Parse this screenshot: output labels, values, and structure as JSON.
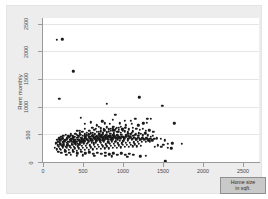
{
  "chart_data": {
    "type": "scatter",
    "title": "",
    "xlabel": "Home size in sqft.",
    "ylabel": "Rent monthly",
    "xlim": [
      0,
      2700
    ],
    "ylim": [
      0,
      2600
    ],
    "xticks": [
      0,
      500,
      1000,
      1500,
      2000,
      2500
    ],
    "yticks": [
      0,
      500,
      1000,
      1500,
      2000,
      2500
    ],
    "xtick_labels": [
      "0",
      "500",
      "1000",
      "1500",
      "2000",
      "2500"
    ],
    "ytick_labels": [
      "0",
      "500",
      "1000",
      "1500",
      "2000",
      "2500"
    ],
    "grid": "horizontal",
    "legend": "none",
    "marker_color": "#1a1a1a",
    "plot_bg": "#ffffff",
    "graph_bg": "#ededed",
    "gridline_color": "#e6e6e6",
    "points": [
      [
        170,
        2205
      ],
      [
        240,
        2215
      ],
      [
        380,
        1640
      ],
      [
        205,
        1145
      ],
      [
        800,
        1055
      ],
      [
        1205,
        1170
      ],
      [
        1490,
        1010
      ],
      [
        470,
        800
      ],
      [
        905,
        855
      ],
      [
        1305,
        785
      ],
      [
        1345,
        780
      ],
      [
        1640,
        700
      ],
      [
        775,
        700
      ],
      [
        835,
        690
      ],
      [
        700,
        640
      ],
      [
        960,
        700
      ],
      [
        1035,
        660
      ],
      [
        1110,
        690
      ],
      [
        1190,
        660
      ],
      [
        1255,
        700
      ],
      [
        1295,
        705
      ],
      [
        615,
        620
      ],
      [
        660,
        600
      ],
      [
        720,
        610
      ],
      [
        760,
        590
      ],
      [
        800,
        625
      ],
      [
        845,
        600
      ],
      [
        880,
        640
      ],
      [
        910,
        600
      ],
      [
        950,
        615
      ],
      [
        990,
        590
      ],
      [
        1030,
        620
      ],
      [
        1075,
        590
      ],
      [
        1120,
        620
      ],
      [
        1165,
        600
      ],
      [
        1210,
        585
      ],
      [
        1250,
        600
      ],
      [
        1285,
        560
      ],
      [
        1330,
        575
      ],
      [
        1380,
        545
      ],
      [
        1425,
        430
      ],
      [
        1470,
        420
      ],
      [
        1520,
        390
      ],
      [
        1560,
        330
      ],
      [
        1615,
        340
      ],
      [
        1735,
        330
      ],
      [
        430,
        560
      ],
      [
        460,
        520
      ],
      [
        490,
        545
      ],
      [
        520,
        500
      ],
      [
        545,
        530
      ],
      [
        570,
        490
      ],
      [
        595,
        515
      ],
      [
        620,
        480
      ],
      [
        645,
        505
      ],
      [
        670,
        470
      ],
      [
        695,
        495
      ],
      [
        715,
        465
      ],
      [
        740,
        490
      ],
      [
        765,
        455
      ],
      [
        790,
        480
      ],
      [
        815,
        450
      ],
      [
        840,
        470
      ],
      [
        865,
        440
      ],
      [
        890,
        465
      ],
      [
        915,
        435
      ],
      [
        940,
        460
      ],
      [
        965,
        430
      ],
      [
        990,
        455
      ],
      [
        1015,
        425
      ],
      [
        1040,
        450
      ],
      [
        1065,
        420
      ],
      [
        1090,
        445
      ],
      [
        1115,
        415
      ],
      [
        1140,
        440
      ],
      [
        1165,
        410
      ],
      [
        1190,
        435
      ],
      [
        1215,
        405
      ],
      [
        1240,
        430
      ],
      [
        1265,
        400
      ],
      [
        1290,
        425
      ],
      [
        1315,
        395
      ],
      [
        1340,
        420
      ],
      [
        1365,
        390
      ],
      [
        1390,
        415
      ],
      [
        160,
        330
      ],
      [
        185,
        300
      ],
      [
        210,
        350
      ],
      [
        235,
        290
      ],
      [
        260,
        330
      ],
      [
        285,
        270
      ],
      [
        310,
        320
      ],
      [
        335,
        280
      ],
      [
        360,
        330
      ],
      [
        385,
        270
      ],
      [
        410,
        320
      ],
      [
        435,
        285
      ],
      [
        460,
        335
      ],
      [
        485,
        290
      ],
      [
        510,
        340
      ],
      [
        535,
        295
      ],
      [
        560,
        345
      ],
      [
        585,
        300
      ],
      [
        610,
        350
      ],
      [
        635,
        305
      ],
      [
        660,
        355
      ],
      [
        685,
        310
      ],
      [
        710,
        360
      ],
      [
        735,
        315
      ],
      [
        760,
        365
      ],
      [
        785,
        320
      ],
      [
        810,
        370
      ],
      [
        835,
        325
      ],
      [
        860,
        375
      ],
      [
        885,
        330
      ],
      [
        910,
        380
      ],
      [
        935,
        335
      ],
      [
        960,
        385
      ],
      [
        985,
        340
      ],
      [
        1010,
        390
      ],
      [
        1035,
        345
      ],
      [
        1060,
        395
      ],
      [
        1085,
        350
      ],
      [
        1110,
        400
      ],
      [
        1135,
        355
      ],
      [
        1160,
        405
      ],
      [
        1185,
        360
      ],
      [
        1210,
        410
      ],
      [
        1235,
        365
      ],
      [
        1260,
        415
      ],
      [
        1285,
        370
      ],
      [
        1310,
        420
      ],
      [
        1335,
        375
      ],
      [
        150,
        260
      ],
      [
        175,
        230
      ],
      [
        200,
        270
      ],
      [
        225,
        225
      ],
      [
        250,
        265
      ],
      [
        275,
        220
      ],
      [
        300,
        260
      ],
      [
        325,
        215
      ],
      [
        350,
        255
      ],
      [
        375,
        210
      ],
      [
        400,
        250
      ],
      [
        425,
        205
      ],
      [
        450,
        245
      ],
      [
        475,
        215
      ],
      [
        500,
        255
      ],
      [
        525,
        220
      ],
      [
        550,
        260
      ],
      [
        575,
        225
      ],
      [
        600,
        265
      ],
      [
        625,
        230
      ],
      [
        650,
        270
      ],
      [
        675,
        235
      ],
      [
        700,
        275
      ],
      [
        725,
        240
      ],
      [
        750,
        280
      ],
      [
        775,
        245
      ],
      [
        800,
        285
      ],
      [
        825,
        250
      ],
      [
        850,
        290
      ],
      [
        875,
        255
      ],
      [
        900,
        295
      ],
      [
        925,
        260
      ],
      [
        950,
        300
      ],
      [
        975,
        265
      ],
      [
        1000,
        305
      ],
      [
        1025,
        270
      ],
      [
        1050,
        310
      ],
      [
        1075,
        275
      ],
      [
        1100,
        315
      ],
      [
        1125,
        280
      ],
      [
        1150,
        320
      ],
      [
        1175,
        285
      ],
      [
        1200,
        325
      ],
      [
        1225,
        290
      ],
      [
        300,
        430
      ],
      [
        330,
        455
      ],
      [
        355,
        410
      ],
      [
        380,
        445
      ],
      [
        405,
        400
      ],
      [
        430,
        440
      ],
      [
        455,
        395
      ],
      [
        480,
        435
      ],
      [
        505,
        400
      ],
      [
        530,
        445
      ],
      [
        555,
        405
      ],
      [
        580,
        450
      ],
      [
        605,
        410
      ],
      [
        630,
        455
      ],
      [
        655,
        415
      ],
      [
        680,
        460
      ],
      [
        705,
        420
      ],
      [
        730,
        465
      ],
      [
        755,
        425
      ],
      [
        780,
        470
      ],
      [
        805,
        430
      ],
      [
        830,
        475
      ],
      [
        855,
        435
      ],
      [
        880,
        480
      ],
      [
        905,
        440
      ],
      [
        930,
        485
      ],
      [
        955,
        445
      ],
      [
        980,
        490
      ],
      [
        1005,
        450
      ],
      [
        215,
        390
      ],
      [
        240,
        420
      ],
      [
        265,
        375
      ],
      [
        290,
        405
      ],
      [
        315,
        370
      ],
      [
        340,
        400
      ],
      [
        365,
        360
      ],
      [
        390,
        395
      ],
      [
        415,
        365
      ],
      [
        440,
        405
      ],
      [
        465,
        370
      ],
      [
        490,
        410
      ],
      [
        515,
        375
      ],
      [
        540,
        415
      ],
      [
        565,
        380
      ],
      [
        590,
        420
      ],
      [
        615,
        385
      ],
      [
        640,
        425
      ],
      [
        665,
        390
      ],
      [
        690,
        430
      ],
      [
        715,
        395
      ],
      [
        740,
        435
      ],
      [
        765,
        400
      ],
      [
        790,
        440
      ],
      [
        815,
        405
      ],
      [
        840,
        445
      ],
      [
        865,
        410
      ],
      [
        890,
        450
      ],
      [
        915,
        415
      ],
      [
        190,
        180
      ],
      [
        230,
        170
      ],
      [
        280,
        190
      ],
      [
        330,
        165
      ],
      [
        380,
        185
      ],
      [
        430,
        160
      ],
      [
        480,
        180
      ],
      [
        530,
        155
      ],
      [
        580,
        175
      ],
      [
        630,
        150
      ],
      [
        680,
        170
      ],
      [
        730,
        145
      ],
      [
        780,
        165
      ],
      [
        830,
        140
      ],
      [
        880,
        160
      ],
      [
        930,
        135
      ],
      [
        980,
        155
      ],
      [
        1030,
        130
      ],
      [
        1080,
        150
      ],
      [
        1130,
        125
      ],
      [
        460,
        560
      ],
      [
        520,
        600
      ],
      [
        580,
        565
      ],
      [
        640,
        580
      ],
      [
        700,
        545
      ],
      [
        760,
        560
      ],
      [
        820,
        545
      ],
      [
        880,
        575
      ],
      [
        940,
        540
      ],
      [
        1000,
        560
      ],
      [
        1060,
        535
      ],
      [
        1120,
        555
      ],
      [
        520,
        690
      ],
      [
        600,
        720
      ],
      [
        670,
        665
      ],
      [
        740,
        735
      ],
      [
        870,
        760
      ],
      [
        1020,
        745
      ],
      [
        1100,
        745
      ],
      [
        1155,
        775
      ],
      [
        255,
        470
      ],
      [
        285,
        495
      ],
      [
        315,
        465
      ],
      [
        345,
        500
      ],
      [
        375,
        470
      ],
      [
        405,
        505
      ],
      [
        435,
        475
      ],
      [
        465,
        490
      ],
      [
        1530,
        10
      ],
      [
        1055,
        95
      ],
      [
        860,
        100
      ],
      [
        780,
        115
      ],
      [
        640,
        110
      ],
      [
        500,
        120
      ],
      [
        420,
        115
      ],
      [
        350,
        130
      ],
      [
        290,
        125
      ],
      [
        1215,
        105
      ],
      [
        1285,
        115
      ],
      [
        1400,
        270
      ],
      [
        1435,
        300
      ],
      [
        1480,
        275
      ],
      [
        1505,
        310
      ],
      [
        1560,
        255
      ],
      [
        1605,
        250
      ],
      [
        210,
        240
      ],
      [
        255,
        300
      ],
      [
        300,
        345
      ],
      [
        345,
        385
      ],
      [
        390,
        355
      ],
      [
        435,
        330
      ],
      [
        480,
        375
      ],
      [
        525,
        420
      ],
      [
        570,
        440
      ],
      [
        615,
        470
      ],
      [
        660,
        445
      ],
      [
        705,
        500
      ],
      [
        750,
        515
      ],
      [
        795,
        530
      ],
      [
        840,
        505
      ],
      [
        885,
        520
      ],
      [
        930,
        545
      ],
      [
        975,
        525
      ],
      [
        1020,
        555
      ],
      [
        1065,
        505
      ],
      [
        1110,
        530
      ],
      [
        1155,
        490
      ],
      [
        1200,
        520
      ],
      [
        180,
        405
      ],
      [
        205,
        430
      ],
      [
        230,
        460
      ],
      [
        250,
        425
      ],
      [
        270,
        395
      ],
      [
        295,
        415
      ],
      [
        320,
        445
      ],
      [
        345,
        470
      ],
      [
        370,
        430
      ],
      [
        395,
        455
      ],
      [
        420,
        490
      ],
      [
        445,
        465
      ],
      [
        470,
        440
      ],
      [
        495,
        475
      ],
      [
        520,
        465
      ],
      [
        545,
        480
      ],
      [
        570,
        500
      ],
      [
        595,
        460
      ],
      [
        620,
        525
      ],
      [
        645,
        490
      ],
      [
        670,
        540
      ],
      [
        695,
        510
      ],
      [
        720,
        555
      ],
      [
        745,
        530
      ],
      [
        770,
        575
      ],
      [
        795,
        545
      ],
      [
        820,
        590
      ],
      [
        845,
        560
      ],
      [
        870,
        605
      ],
      [
        895,
        575
      ],
      [
        920,
        620
      ],
      [
        945,
        585
      ],
      [
        970,
        630
      ],
      [
        995,
        600
      ],
      [
        165,
        345
      ],
      [
        190,
        365
      ],
      [
        215,
        320
      ],
      [
        245,
        355
      ],
      [
        275,
        385
      ],
      [
        305,
        300
      ],
      [
        335,
        360
      ],
      [
        365,
        315
      ],
      [
        395,
        340
      ],
      [
        425,
        370
      ],
      [
        455,
        310
      ],
      [
        485,
        355
      ],
      [
        515,
        385
      ],
      [
        545,
        325
      ],
      [
        575,
        370
      ],
      [
        605,
        395
      ],
      [
        635,
        335
      ],
      [
        665,
        380
      ],
      [
        695,
        405
      ],
      [
        725,
        345
      ],
      [
        755,
        390
      ],
      [
        785,
        415
      ],
      [
        815,
        355
      ],
      [
        845,
        400
      ],
      [
        875,
        425
      ],
      [
        905,
        365
      ],
      [
        935,
        410
      ],
      [
        965,
        435
      ],
      [
        995,
        375
      ],
      [
        1040,
        480
      ],
      [
        1070,
        465
      ],
      [
        1100,
        500
      ],
      [
        1130,
        470
      ],
      [
        1160,
        505
      ],
      [
        1190,
        475
      ],
      [
        1220,
        510
      ],
      [
        1250,
        480
      ],
      [
        1280,
        515
      ],
      [
        1310,
        485
      ],
      [
        1345,
        455
      ],
      [
        1375,
        470
      ]
    ]
  }
}
